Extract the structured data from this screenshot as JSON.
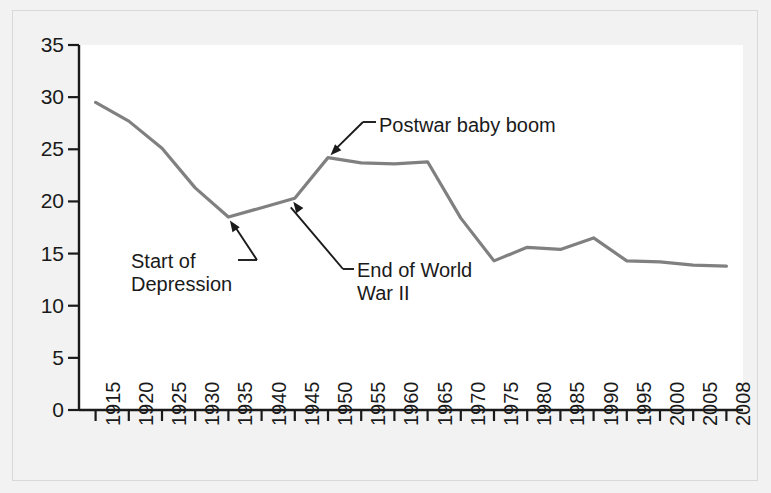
{
  "chart_data": {
    "type": "line",
    "title": "",
    "xlabel": "",
    "ylabel": "",
    "xlim": [
      1915,
      2008
    ],
    "ylim": [
      0,
      35
    ],
    "grid": false,
    "legend": "none",
    "y_ticks": [
      0,
      5,
      10,
      15,
      20,
      25,
      30,
      35
    ],
    "x_ticks": [
      1915,
      1920,
      1925,
      1930,
      1935,
      1940,
      1945,
      1950,
      1955,
      1960,
      1965,
      1970,
      1975,
      1980,
      1985,
      1990,
      1995,
      2000,
      2005,
      2008
    ],
    "x_tick_labels": [
      "1915",
      "1920",
      "1925",
      "1930",
      "1935",
      "1940",
      "1945",
      "1950",
      "1955",
      "1960",
      "1965",
      "1970",
      "1975",
      "1980",
      "1985",
      "1990",
      "1995",
      "2000",
      "2005",
      "2008"
    ],
    "line_color": "#808080",
    "series": [
      {
        "name": "Birth rate",
        "x": [
          1915,
          1920,
          1925,
          1930,
          1935,
          1940,
          1945,
          1950,
          1955,
          1960,
          1965,
          1970,
          1975,
          1980,
          1985,
          1990,
          1995,
          2000,
          2005,
          2008
        ],
        "values": [
          29.5,
          27.7,
          25.1,
          21.3,
          18.5,
          19.4,
          20.3,
          24.2,
          23.7,
          23.6,
          23.8,
          18.4,
          14.3,
          15.6,
          15.4,
          16.5,
          14.3,
          14.2,
          13.9,
          13.8
        ]
      }
    ],
    "annotations": [
      {
        "id": "start-of-depression",
        "text_line1": "Start of",
        "text_line2": "Depression",
        "target_x": 1935,
        "target_y": 18.5
      },
      {
        "id": "end-of-world-war-ii",
        "text_line1": "End of World",
        "text_line2": "War II",
        "target_x": 1945,
        "target_y": 20.3
      },
      {
        "id": "postwar-baby-boom",
        "text_line1": "Postwar baby boom",
        "text_line2": "",
        "target_x": 1950,
        "target_y": 24.2
      }
    ]
  },
  "axis": {
    "y_labels": [
      "35",
      "30",
      "25",
      "20",
      "15",
      "10",
      "5",
      "0"
    ],
    "x_labels": [
      "1915",
      "1920",
      "1925",
      "1930",
      "1935",
      "1940",
      "1945",
      "1950",
      "1955",
      "1960",
      "1965",
      "1970",
      "1975",
      "1980",
      "1985",
      "1990",
      "1995",
      "2000",
      "2005",
      "2008"
    ]
  },
  "annotations": {
    "depression_line1": "Start of",
    "depression_line2": "Depression",
    "ww2_line1": "End of World",
    "ww2_line2": "War II",
    "babyboom": "Postwar baby boom"
  },
  "colors": {
    "line": "#808080",
    "axis": "#1a1a1a",
    "plot_bg": "#ffffff",
    "page_bg": "#f2f2f2"
  }
}
